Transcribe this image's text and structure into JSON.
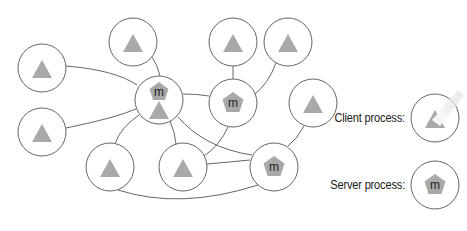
{
  "colors": {
    "circle_stroke": "#666666",
    "edge_stroke": "#555555",
    "shape_fill": "#a9a9a9",
    "text": "#222222"
  },
  "server_symbol": "m",
  "nodes": [
    {
      "id": "A",
      "type": "client",
      "x": 42,
      "y": 68
    },
    {
      "id": "B",
      "type": "client",
      "x": 42,
      "y": 132
    },
    {
      "id": "C",
      "type": "client",
      "x": 133,
      "y": 42
    },
    {
      "id": "D",
      "type": "client",
      "x": 233,
      "y": 42
    },
    {
      "id": "E",
      "type": "client",
      "x": 288,
      "y": 42
    },
    {
      "id": "F",
      "type": "server+client",
      "x": 159,
      "y": 100
    },
    {
      "id": "G",
      "type": "server",
      "x": 233,
      "y": 103
    },
    {
      "id": "H",
      "type": "client",
      "x": 313,
      "y": 103
    },
    {
      "id": "I",
      "type": "client",
      "x": 110,
      "y": 167
    },
    {
      "id": "J",
      "type": "client",
      "x": 183,
      "y": 167
    },
    {
      "id": "K",
      "type": "server",
      "x": 274,
      "y": 167
    }
  ],
  "edges": [
    {
      "from": "A",
      "to": "F",
      "path": "M66,66 Q115,70 137,85"
    },
    {
      "from": "B",
      "to": "F",
      "path": "M66,128 Q115,118 136,109"
    },
    {
      "from": "C",
      "to": "F",
      "path": "M152,57 Q158,66 160,76"
    },
    {
      "from": "F",
      "to": "G",
      "path": "M183,94 Q197,94 209,96"
    },
    {
      "from": "D",
      "to": "G",
      "path": "M233,66 L233,79"
    },
    {
      "from": "E",
      "to": "G",
      "path": "M276,63 Q268,84 255,94"
    },
    {
      "from": "F",
      "to": "I",
      "path": "M139,115 Q120,128 115,144"
    },
    {
      "from": "F",
      "to": "J",
      "path": "M170,121 Q175,132 176,144"
    },
    {
      "from": "F",
      "to": "K",
      "path": "M178,117 Q205,148 252,155"
    },
    {
      "from": "G",
      "to": "J",
      "path": "M228,127 Q220,145 204,156"
    },
    {
      "from": "J",
      "to": "K",
      "path": "M207,164 Q230,162 250,160"
    },
    {
      "from": "H",
      "to": "K",
      "path": "M304,126 Q298,138 288,146"
    },
    {
      "from": "I",
      "to": "K",
      "path": "M118,190 Q180,210 258,185"
    }
  ],
  "legend": {
    "client_label": "Client process:",
    "server_label": "Server process:",
    "client_node": {
      "x": 435,
      "y": 118
    },
    "server_node": {
      "x": 435,
      "y": 185
    }
  }
}
